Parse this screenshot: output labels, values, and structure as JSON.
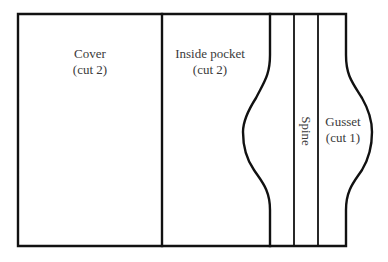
{
  "diagram": {
    "title": "",
    "line_color": "#111111",
    "text_color": "#3a3a3a",
    "pieces": [
      {
        "name": "cover",
        "label": "Cover",
        "note": "(cut 2)"
      },
      {
        "name": "inside-pocket",
        "label": "Inside pocket",
        "note": "(cut 2)"
      },
      {
        "name": "spine",
        "label": "Spine",
        "note": ""
      },
      {
        "name": "gusset",
        "label": "Gusset",
        "note": "(cut 1)"
      }
    ]
  }
}
